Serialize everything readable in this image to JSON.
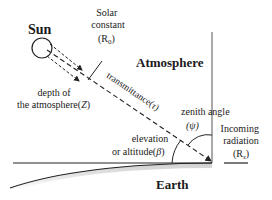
{
  "diagram": {
    "type": "solar-geometry",
    "labels": {
      "sun": "Sun",
      "solar_constant_line1": "Solar",
      "solar_constant_line2": "constant",
      "solar_constant_symbol": "(R",
      "solar_constant_sub": "0",
      "solar_constant_close": ")",
      "depth_line1": "depth of",
      "depth_line2": "the atmosphere(",
      "depth_symbol": "Z",
      "depth_close": ")",
      "transmittance": "transmittance(",
      "transmittance_symbol": "τ",
      "transmittance_close": ")",
      "atmosphere": "Atmosphere",
      "zenith_line1": "zenith angle",
      "zenith_symbol": "(ψ)",
      "elevation_line1": "elevation",
      "elevation_line2": "or altitude(",
      "elevation_symbol": "β",
      "elevation_close": ")",
      "incoming_line1": "Incoming",
      "incoming_line2": "radiation",
      "incoming_symbol": "(R",
      "incoming_sub": "s",
      "incoming_close": ")",
      "earth": "Earth"
    },
    "colors": {
      "line": "#222222",
      "text": "#1a1a1a",
      "earth_shade": "#bdbdbd"
    }
  }
}
